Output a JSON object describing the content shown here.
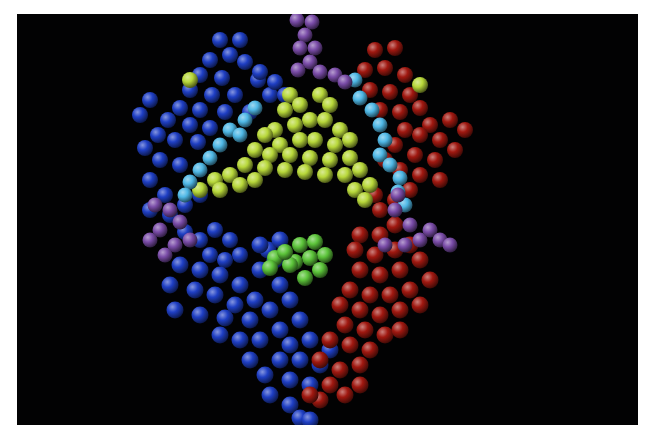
{
  "image": {
    "description": "Space-filling molecular model of a protein complex rendered as colored spheres on a black background",
    "background": "#020203",
    "border": "#ffffff"
  },
  "colors": {
    "blue": "#1f3fc4",
    "red": "#a01810",
    "yellow_green": "#b8d83a",
    "cyan": "#4fb8e6",
    "purple": "#7a4ca8",
    "green": "#5cc43a"
  },
  "clusters": [
    {
      "name": "blue-upper-left",
      "color": "blue",
      "r": 8,
      "atoms": [
        [
          220,
          40
        ],
        [
          240,
          40
        ],
        [
          230,
          55
        ],
        [
          210,
          60
        ],
        [
          245,
          62
        ],
        [
          200,
          75
        ],
        [
          222,
          78
        ],
        [
          258,
          80
        ],
        [
          190,
          90
        ],
        [
          212,
          95
        ],
        [
          235,
          95
        ],
        [
          270,
          95
        ],
        [
          180,
          108
        ],
        [
          200,
          110
        ],
        [
          225,
          112
        ],
        [
          250,
          112
        ],
        [
          168,
          120
        ],
        [
          190,
          125
        ],
        [
          210,
          128
        ],
        [
          150,
          100
        ],
        [
          140,
          115
        ],
        [
          158,
          135
        ],
        [
          145,
          148
        ],
        [
          175,
          140
        ],
        [
          198,
          142
        ],
        [
          160,
          160
        ],
        [
          180,
          165
        ],
        [
          260,
          72
        ],
        [
          275,
          82
        ],
        [
          285,
          95
        ]
      ]
    },
    {
      "name": "blue-left-mid",
      "color": "blue",
      "r": 8,
      "atoms": [
        [
          150,
          180
        ],
        [
          165,
          195
        ],
        [
          150,
          210
        ],
        [
          170,
          215
        ],
        [
          185,
          205
        ],
        [
          200,
          195
        ],
        [
          215,
          230
        ],
        [
          230,
          240
        ],
        [
          200,
          240
        ],
        [
          185,
          232
        ],
        [
          240,
          255
        ],
        [
          225,
          260
        ],
        [
          210,
          255
        ]
      ]
    },
    {
      "name": "blue-lower",
      "color": "blue",
      "r": 8.5,
      "atoms": [
        [
          180,
          265
        ],
        [
          200,
          270
        ],
        [
          220,
          275
        ],
        [
          170,
          285
        ],
        [
          195,
          290
        ],
        [
          215,
          295
        ],
        [
          240,
          285
        ],
        [
          260,
          270
        ],
        [
          275,
          260
        ],
        [
          280,
          285
        ],
        [
          255,
          300
        ],
        [
          235,
          305
        ],
        [
          175,
          310
        ],
        [
          200,
          315
        ],
        [
          225,
          318
        ],
        [
          250,
          320
        ],
        [
          270,
          310
        ],
        [
          290,
          300
        ],
        [
          300,
          320
        ],
        [
          280,
          330
        ],
        [
          260,
          340
        ],
        [
          240,
          340
        ],
        [
          220,
          335
        ],
        [
          290,
          345
        ],
        [
          310,
          340
        ],
        [
          330,
          350
        ],
        [
          320,
          365
        ],
        [
          300,
          360
        ],
        [
          280,
          360
        ],
        [
          265,
          375
        ],
        [
          290,
          380
        ],
        [
          310,
          385
        ],
        [
          250,
          360
        ],
        [
          270,
          395
        ],
        [
          290,
          405
        ],
        [
          300,
          418
        ],
        [
          310,
          420
        ],
        [
          268,
          250
        ],
        [
          280,
          240
        ],
        [
          260,
          245
        ]
      ]
    },
    {
      "name": "red-upper-right",
      "color": "red",
      "r": 8,
      "atoms": [
        [
          375,
          50
        ],
        [
          395,
          48
        ],
        [
          365,
          70
        ],
        [
          385,
          68
        ],
        [
          405,
          75
        ],
        [
          370,
          90
        ],
        [
          390,
          92
        ],
        [
          410,
          95
        ],
        [
          380,
          110
        ],
        [
          400,
          112
        ],
        [
          420,
          108
        ],
        [
          430,
          125
        ],
        [
          450,
          120
        ],
        [
          465,
          130
        ],
        [
          440,
          140
        ],
        [
          455,
          150
        ],
        [
          420,
          135
        ],
        [
          405,
          130
        ],
        [
          395,
          145
        ],
        [
          415,
          155
        ],
        [
          435,
          160
        ],
        [
          385,
          160
        ],
        [
          400,
          170
        ],
        [
          420,
          175
        ],
        [
          440,
          180
        ],
        [
          410,
          190
        ],
        [
          395,
          200
        ],
        [
          380,
          210
        ],
        [
          375,
          195
        ]
      ]
    },
    {
      "name": "red-lower-right",
      "color": "red",
      "r": 8.5,
      "atoms": [
        [
          360,
          235
        ],
        [
          380,
          235
        ],
        [
          355,
          250
        ],
        [
          375,
          255
        ],
        [
          395,
          250
        ],
        [
          360,
          270
        ],
        [
          380,
          275
        ],
        [
          400,
          270
        ],
        [
          420,
          260
        ],
        [
          430,
          280
        ],
        [
          410,
          290
        ],
        [
          390,
          295
        ],
        [
          370,
          295
        ],
        [
          350,
          290
        ],
        [
          340,
          305
        ],
        [
          360,
          310
        ],
        [
          380,
          315
        ],
        [
          400,
          310
        ],
        [
          420,
          305
        ],
        [
          345,
          325
        ],
        [
          365,
          330
        ],
        [
          385,
          335
        ],
        [
          400,
          330
        ],
        [
          330,
          340
        ],
        [
          350,
          345
        ],
        [
          370,
          350
        ],
        [
          320,
          360
        ],
        [
          340,
          370
        ],
        [
          360,
          365
        ],
        [
          330,
          385
        ],
        [
          345,
          395
        ],
        [
          320,
          400
        ],
        [
          310,
          395
        ],
        [
          360,
          385
        ],
        [
          410,
          245
        ],
        [
          395,
          225
        ]
      ]
    },
    {
      "name": "yellow-green-core",
      "color": "yellow_green",
      "r": 8,
      "atoms": [
        [
          290,
          95
        ],
        [
          300,
          105
        ],
        [
          285,
          110
        ],
        [
          310,
          120
        ],
        [
          295,
          125
        ],
        [
          275,
          130
        ],
        [
          320,
          95
        ],
        [
          330,
          105
        ],
        [
          325,
          120
        ],
        [
          340,
          130
        ],
        [
          350,
          140
        ],
        [
          335,
          145
        ],
        [
          315,
          140
        ],
        [
          300,
          140
        ],
        [
          280,
          145
        ],
        [
          265,
          135
        ],
        [
          255,
          150
        ],
        [
          270,
          155
        ],
        [
          290,
          155
        ],
        [
          310,
          158
        ],
        [
          330,
          160
        ],
        [
          350,
          158
        ],
        [
          360,
          170
        ],
        [
          345,
          175
        ],
        [
          325,
          175
        ],
        [
          305,
          172
        ],
        [
          285,
          170
        ],
        [
          265,
          168
        ],
        [
          245,
          165
        ],
        [
          230,
          175
        ],
        [
          215,
          180
        ],
        [
          200,
          190
        ],
        [
          220,
          190
        ],
        [
          240,
          185
        ],
        [
          255,
          180
        ],
        [
          370,
          185
        ],
        [
          355,
          190
        ],
        [
          365,
          200
        ],
        [
          190,
          80
        ],
        [
          420,
          85
        ]
      ]
    },
    {
      "name": "cyan-chain-left",
      "color": "cyan",
      "r": 7.5,
      "atoms": [
        [
          255,
          108
        ],
        [
          245,
          120
        ],
        [
          230,
          130
        ],
        [
          240,
          135
        ],
        [
          220,
          145
        ],
        [
          210,
          158
        ],
        [
          200,
          170
        ],
        [
          190,
          182
        ],
        [
          185,
          195
        ]
      ]
    },
    {
      "name": "cyan-chain-right",
      "color": "cyan",
      "r": 7.5,
      "atoms": [
        [
          355,
          80
        ],
        [
          360,
          98
        ],
        [
          372,
          110
        ],
        [
          380,
          125
        ],
        [
          385,
          140
        ],
        [
          380,
          155
        ],
        [
          390,
          165
        ],
        [
          400,
          178
        ],
        [
          398,
          192
        ],
        [
          405,
          205
        ]
      ]
    },
    {
      "name": "purple-top",
      "color": "purple",
      "r": 7.5,
      "atoms": [
        [
          297,
          20
        ],
        [
          312,
          22
        ],
        [
          305,
          35
        ],
        [
          300,
          48
        ],
        [
          315,
          48
        ],
        [
          310,
          62
        ],
        [
          298,
          70
        ],
        [
          320,
          72
        ],
        [
          335,
          75
        ],
        [
          345,
          82
        ]
      ]
    },
    {
      "name": "purple-left",
      "color": "purple",
      "r": 7.5,
      "atoms": [
        [
          155,
          205
        ],
        [
          170,
          210
        ],
        [
          180,
          222
        ],
        [
          160,
          230
        ],
        [
          190,
          240
        ],
        [
          175,
          245
        ],
        [
          150,
          240
        ],
        [
          165,
          255
        ]
      ]
    },
    {
      "name": "purple-right",
      "color": "purple",
      "r": 7.5,
      "atoms": [
        [
          395,
          210
        ],
        [
          410,
          225
        ],
        [
          420,
          240
        ],
        [
          405,
          245
        ],
        [
          430,
          230
        ],
        [
          440,
          240
        ],
        [
          450,
          245
        ],
        [
          385,
          245
        ],
        [
          398,
          195
        ]
      ]
    },
    {
      "name": "green-center",
      "color": "green",
      "r": 8,
      "atoms": [
        [
          300,
          245
        ],
        [
          315,
          242
        ],
        [
          325,
          255
        ],
        [
          310,
          258
        ],
        [
          295,
          262
        ],
        [
          320,
          270
        ],
        [
          305,
          278
        ],
        [
          275,
          258
        ],
        [
          270,
          268
        ],
        [
          290,
          265
        ],
        [
          285,
          252
        ]
      ]
    }
  ]
}
